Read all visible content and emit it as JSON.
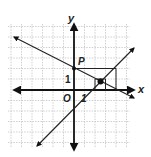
{
  "diagram": {
    "type": "coordinate-plane",
    "axes": {
      "x_label": "x",
      "y_label": "y",
      "origin_label": "O"
    },
    "tick_labels": {
      "x_unit": "1",
      "y_unit": "1"
    },
    "point_label": "P",
    "colors": {
      "grid": "#bdbdbd",
      "axis": "#111111",
      "line": "#222222",
      "background": "#ffffff"
    },
    "lines": [
      {
        "name": "decreasing-line",
        "through": [
          [
            0,
            2
          ],
          [
            4,
            0
          ]
        ],
        "slope": -0.5
      },
      {
        "name": "increasing-line",
        "through": [
          [
            1,
            0
          ],
          [
            2,
            1
          ]
        ],
        "slope": 1
      }
    ],
    "points": [
      {
        "name": "P",
        "x": 0,
        "y": 2
      },
      {
        "name": "intersection",
        "x": 2.5,
        "y": 0.8
      }
    ],
    "grid": {
      "x_range": [
        -6,
        6
      ],
      "y_range": [
        -5,
        6
      ]
    }
  }
}
